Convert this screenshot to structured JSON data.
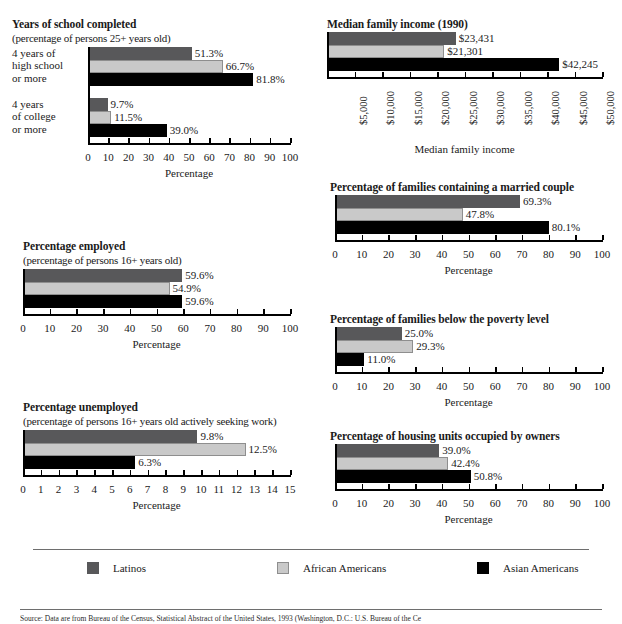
{
  "figure": {
    "groups": [
      {
        "key": "latinos",
        "label": "Latinos",
        "color": "#58585a"
      },
      {
        "key": "african_americans",
        "label": "African Americans",
        "color": "#c9c9c9"
      },
      {
        "key": "asian_americans",
        "label": "Asian Americans",
        "color": "#000000"
      }
    ],
    "legend": {
      "items": [
        {
          "label": "Latinos",
          "swatch": "dark-gray-swatch"
        },
        {
          "label": "African Americans",
          "swatch": "light-gray-swatch"
        },
        {
          "label": "Asian Americans",
          "swatch": "black-swatch"
        }
      ]
    },
    "source_note": "Source: Data are from Bureau of the Census, Statistical Abstract of the United States, 1993 (Washington, D.C.: U.S. Bureau of the Ce"
  },
  "chart_data": [
    {
      "id": "years-of-school-completed",
      "type": "bar",
      "orientation": "horizontal",
      "title": "Years of school completed",
      "subtitle": "(percentage of persons 25+ years old)",
      "xlabel": "Percentage",
      "ylabel": "",
      "xlim": [
        0,
        100
      ],
      "xticks": [
        0,
        10,
        20,
        30,
        40,
        50,
        60,
        70,
        80,
        90,
        100
      ],
      "xticklabels": [
        "0",
        "10",
        "20",
        "30",
        "40",
        "50",
        "60",
        "70",
        "80",
        "90",
        "100"
      ],
      "grid": false,
      "categories": [
        "4 years of high school or more",
        "4 years of college or more"
      ],
      "category_lines": [
        [
          "4 years of",
          "high school",
          "or more"
        ],
        [
          "4 years",
          "of college",
          "or more"
        ]
      ],
      "series": [
        {
          "name": "Latinos",
          "values": [
            51.3,
            9.7
          ],
          "labels": [
            "51.3%",
            "9.7%"
          ]
        },
        {
          "name": "African Americans",
          "values": [
            66.7,
            11.5
          ],
          "labels": [
            "66.7%",
            "11.5%"
          ]
        },
        {
          "name": "Asian Americans",
          "values": [
            81.8,
            39.0
          ],
          "labels": [
            "81.8%",
            "39.0%"
          ]
        }
      ]
    },
    {
      "id": "percentage-employed",
      "type": "bar",
      "orientation": "horizontal",
      "title": "Percentage employed",
      "subtitle": "(percentage of persons 16+ years old)",
      "xlabel": "Percentage",
      "ylabel": "",
      "xlim": [
        0,
        100
      ],
      "xticks": [
        0,
        10,
        20,
        30,
        40,
        50,
        60,
        70,
        80,
        90,
        100
      ],
      "xticklabels": [
        "0",
        "10",
        "20",
        "30",
        "40",
        "50",
        "60",
        "70",
        "80",
        "90",
        "100"
      ],
      "grid": false,
      "categories": [
        ""
      ],
      "category_lines": [
        []
      ],
      "series": [
        {
          "name": "Latinos",
          "values": [
            59.6
          ],
          "labels": [
            "59.6%"
          ]
        },
        {
          "name": "African Americans",
          "values": [
            54.9
          ],
          "labels": [
            "54.9%"
          ]
        },
        {
          "name": "Asian Americans",
          "values": [
            59.6
          ],
          "labels": [
            "59.6%"
          ]
        }
      ]
    },
    {
      "id": "percentage-unemployed",
      "type": "bar",
      "orientation": "horizontal",
      "title": "Percentage unemployed",
      "subtitle": "(percentage of persons 16+ years old actively seeking work)",
      "xlabel": "Percentage",
      "ylabel": "",
      "xlim": [
        0,
        15
      ],
      "xticks": [
        0,
        1,
        2,
        3,
        4,
        5,
        6,
        7,
        8,
        9,
        10,
        11,
        12,
        13,
        14,
        15
      ],
      "xticklabels": [
        "0",
        "1",
        "2",
        "3",
        "4",
        "5",
        "6",
        "7",
        "8",
        "9",
        "10",
        "11",
        "12",
        "13",
        "14",
        "15"
      ],
      "grid": false,
      "categories": [
        ""
      ],
      "category_lines": [
        []
      ],
      "series": [
        {
          "name": "Latinos",
          "values": [
            9.8
          ],
          "labels": [
            "9.8%"
          ]
        },
        {
          "name": "African Americans",
          "values": [
            12.5
          ],
          "labels": [
            "12.5%"
          ]
        },
        {
          "name": "Asian Americans",
          "values": [
            6.3
          ],
          "labels": [
            "6.3%"
          ]
        }
      ]
    },
    {
      "id": "median-family-income",
      "type": "bar",
      "orientation": "horizontal",
      "title": "Median family income (1990)",
      "subtitle": "",
      "xlabel": "Median family income",
      "ylabel": "",
      "xlim": [
        0,
        50000
      ],
      "xticks": [
        0,
        5000,
        10000,
        15000,
        20000,
        25000,
        30000,
        35000,
        40000,
        45000,
        50000
      ],
      "xticklabels": [
        "",
        "$5,000",
        "$10,000",
        "$15,000",
        "$20,000",
        "$25,000",
        "$30,000",
        "$35,000",
        "$40,000",
        "$45,000",
        "$50,000"
      ],
      "xticklabel_rotation": -90,
      "grid": false,
      "categories": [
        ""
      ],
      "category_lines": [
        []
      ],
      "series": [
        {
          "name": "Latinos",
          "values": [
            23431
          ],
          "labels": [
            "$23,431"
          ]
        },
        {
          "name": "African Americans",
          "values": [
            21301
          ],
          "labels": [
            "$21,301"
          ]
        },
        {
          "name": "Asian Americans",
          "values": [
            42245
          ],
          "labels": [
            "$42,245"
          ]
        }
      ]
    },
    {
      "id": "families-married-couple",
      "type": "bar",
      "orientation": "horizontal",
      "title": "Percentage of families containing a married couple",
      "subtitle": "",
      "xlabel": "Percentage",
      "ylabel": "",
      "xlim": [
        0,
        100
      ],
      "xticks": [
        0,
        10,
        20,
        30,
        40,
        50,
        60,
        70,
        80,
        90,
        100
      ],
      "xticklabels": [
        "0",
        "10",
        "20",
        "30",
        "40",
        "50",
        "60",
        "70",
        "80",
        "90",
        "100"
      ],
      "grid": false,
      "categories": [
        ""
      ],
      "category_lines": [
        []
      ],
      "series": [
        {
          "name": "Latinos",
          "values": [
            69.3
          ],
          "labels": [
            "69.3%"
          ]
        },
        {
          "name": "African Americans",
          "values": [
            47.8
          ],
          "labels": [
            "47.8%"
          ]
        },
        {
          "name": "Asian Americans",
          "values": [
            80.1
          ],
          "labels": [
            "80.1%"
          ]
        }
      ]
    },
    {
      "id": "families-below-poverty",
      "type": "bar",
      "orientation": "horizontal",
      "title": "Percentage of families below the poverty level",
      "subtitle": "",
      "xlabel": "Percentage",
      "ylabel": "",
      "xlim": [
        0,
        100
      ],
      "xticks": [
        0,
        10,
        20,
        30,
        40,
        50,
        60,
        70,
        80,
        90,
        100
      ],
      "xticklabels": [
        "0",
        "10",
        "20",
        "30",
        "40",
        "50",
        "60",
        "70",
        "80",
        "90",
        "100"
      ],
      "grid": false,
      "categories": [
        ""
      ],
      "category_lines": [
        []
      ],
      "series": [
        {
          "name": "Latinos",
          "values": [
            25.0
          ],
          "labels": [
            "25.0%"
          ]
        },
        {
          "name": "African Americans",
          "values": [
            29.3
          ],
          "labels": [
            "29.3%"
          ]
        },
        {
          "name": "Asian Americans",
          "values": [
            11.0
          ],
          "labels": [
            "11.0%"
          ]
        }
      ]
    },
    {
      "id": "housing-units-owner-occupied",
      "type": "bar",
      "orientation": "horizontal",
      "title": "Percentage of housing units occupied by owners",
      "subtitle": "",
      "xlabel": "Percentage",
      "ylabel": "",
      "xlim": [
        0,
        100
      ],
      "xticks": [
        0,
        10,
        20,
        30,
        40,
        50,
        60,
        70,
        80,
        90,
        100
      ],
      "xticklabels": [
        "0",
        "10",
        "20",
        "30",
        "40",
        "50",
        "60",
        "70",
        "80",
        "90",
        "100"
      ],
      "grid": false,
      "categories": [
        ""
      ],
      "category_lines": [
        []
      ],
      "series": [
        {
          "name": "Latinos",
          "values": [
            39.0
          ],
          "labels": [
            "39.0%"
          ]
        },
        {
          "name": "African Americans",
          "values": [
            42.4
          ],
          "labels": [
            "42.4%"
          ]
        },
        {
          "name": "Asian Americans",
          "values": [
            50.8
          ],
          "labels": [
            "50.8%"
          ]
        }
      ]
    }
  ]
}
